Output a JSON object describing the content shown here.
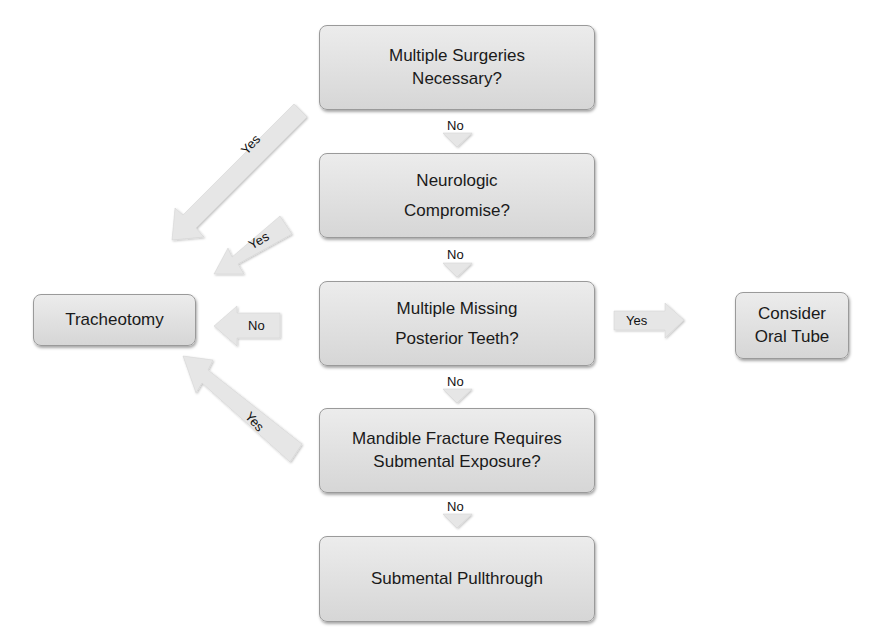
{
  "flowchart": {
    "nodes": {
      "q1": {
        "line1": "Multiple Surgeries",
        "line2": "Necessary?"
      },
      "q2": {
        "line1": "Neurologic",
        "line2": "Compromise?"
      },
      "q3": {
        "line1": "Multiple Missing",
        "line2": "Posterior Teeth?"
      },
      "q4": {
        "line1": "Mandible Fracture Requires",
        "line2": "Submental Exposure?"
      },
      "end_submental": {
        "label": "Submental Pullthrough"
      },
      "end_trach": {
        "label": "Tracheotomy"
      },
      "end_oral": {
        "line1": "Consider",
        "line2": "Oral Tube"
      }
    },
    "edges": {
      "q1_no": "No",
      "q2_no": "No",
      "q3_no": "No",
      "q4_no": "No",
      "q1_yes": "Yes",
      "q2_yes": "Yes",
      "q3_no_left": "No",
      "q4_yes": "Yes",
      "q3_yes_right": "Yes"
    },
    "colors": {
      "box_fill_top": "#ececec",
      "box_fill_bottom": "#d6d6d6",
      "arrow_fill": "#e6e6e6"
    }
  }
}
